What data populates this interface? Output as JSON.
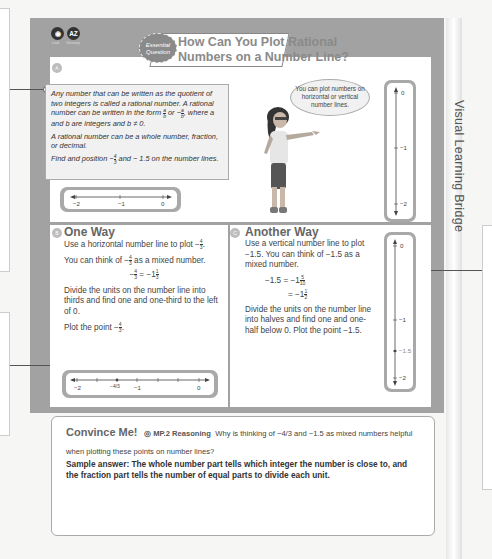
{
  "side_rail": {
    "label": "Visual Learning Bridge"
  },
  "top_icons": [
    {
      "icon": "eye-icon",
      "glyph": "◉",
      "label": "Look"
    },
    {
      "icon": "glossary-icon",
      "glyph": "AZ",
      "label": "Glossary"
    }
  ],
  "badge": {
    "text": "Essential Question"
  },
  "title": {
    "line1": "How Can You Plot Rational",
    "line2": "Numbers on a Number Line?"
  },
  "section_a": {
    "marker": "A",
    "definition": "Any number that can be written as the quotient of two integers is called a rational number. A rational number can be written in the form",
    "form1_num": "a",
    "form1_den": "b",
    "form_or": "or",
    "form2_prefix": "−",
    "form2_num": "a",
    "form2_den": "b",
    "definition_end": ", where a and b are integers and b ≠ 0.",
    "whole": "A rational number can be a whole number, fraction, or decimal.",
    "find_prefix": "Find and position",
    "find_neg": "−",
    "find_num": "4",
    "find_den": "3",
    "find_suffix": "and  − 1.5 on the number lines.",
    "speech": "You can plot numbers on horizontal or vertical number lines.",
    "hline_labels": [
      "−2",
      "−1",
      "0"
    ],
    "vline_labels": [
      "0",
      "−1",
      "−2"
    ]
  },
  "section_b": {
    "marker": "B",
    "title": "One Way",
    "p1": "Use a horizontal number line to plot −",
    "p1_num": "4",
    "p1_den": "3",
    "p2_prefix": "You can think of −",
    "p2_num": "4",
    "p2_den": "3",
    "p2_suffix": "as a mixed number.",
    "eq_lhs_num": "4",
    "eq_lhs_den": "3",
    "eq_mid": "= −1",
    "eq_rhs_num": "1",
    "eq_rhs_den": "3",
    "p3": "Divide the units on the number line into thirds and find one and one-third to the left of 0.",
    "p4": "Plot the point −",
    "p4_num": "4",
    "p4_den": "3",
    "line_labels": [
      "−2",
      "−4/3",
      "−1",
      "0"
    ]
  },
  "section_c": {
    "marker": "C",
    "title": "Another Way",
    "p1": "Use a vertical number line to plot −1.5. You can think of −1.5 as a mixed number.",
    "eq1_lhs": "−1.5 = −1",
    "eq1_num": "5",
    "eq1_den": "10",
    "eq2_lhs": "= −1",
    "eq2_num": "1",
    "eq2_den": "2",
    "p2": "Divide the units on the number line into halves and find one and one-half below 0. Plot the point −1.5.",
    "line_labels": [
      "0",
      "−1",
      "−1.5",
      "−2"
    ]
  },
  "convince": {
    "title": "Convince Me!",
    "practice": "MP.2 Reasoning",
    "question": "Why is thinking of −4/3 and −1.5 as mixed numbers helpful when plotting these points on number lines?",
    "answer": "Sample answer: The whole number part tells which integer the number is close to, and the fraction part tells the number of equal parts to divide each unit."
  }
}
